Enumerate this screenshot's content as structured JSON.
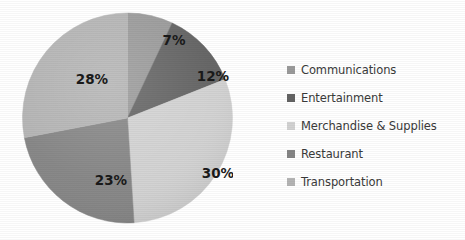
{
  "chart_data": {
    "type": "pie",
    "title": "",
    "categories": [
      "Communications",
      "Entertainment",
      "Merchandise & Supplies",
      "Restaurant",
      "Transportation"
    ],
    "values": [
      7,
      12,
      30,
      23,
      28
    ],
    "value_labels": [
      "7%",
      "12%",
      "30%",
      "23%",
      "28%"
    ],
    "colors": [
      "#9a9a9a",
      "#636363",
      "#d2d2d2",
      "#858585",
      "#b4b4b4"
    ],
    "legend_position": "right",
    "grid": false,
    "start_angle_deg": 0,
    "direction": "clockwise",
    "units": "percent"
  },
  "pie": {
    "slices": [
      {
        "label": "7%",
        "name": "Communications",
        "value": 7,
        "color": "#9a9a9a",
        "label_x": 152,
        "label_y": 32
      },
      {
        "label": "12%",
        "name": "Entertainment",
        "value": 12,
        "color": "#636363",
        "label_x": 191,
        "label_y": 68
      },
      {
        "label": "30%",
        "name": "Merchandise & Supplies",
        "value": 30,
        "color": "#d2d2d2",
        "label_x": 196,
        "label_y": 165
      },
      {
        "label": "23%",
        "name": "Restaurant",
        "value": 23,
        "color": "#858585",
        "label_x": 89,
        "label_y": 172
      },
      {
        "label": "28%",
        "name": "Transportation",
        "value": 28,
        "color": "#b4b4b4",
        "label_x": 70,
        "label_y": 71
      }
    ]
  },
  "legend": {
    "items": [
      {
        "label": "Communications",
        "color": "#9a9a9a"
      },
      {
        "label": "Entertainment",
        "color": "#636363"
      },
      {
        "label": "Merchandise & Supplies",
        "color": "#d2d2d2"
      },
      {
        "label": "Restaurant",
        "color": "#858585"
      },
      {
        "label": "Transportation",
        "color": "#b4b4b4"
      }
    ]
  }
}
